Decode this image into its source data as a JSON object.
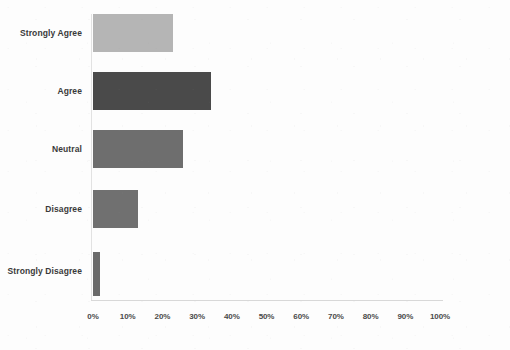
{
  "chart_data": {
    "type": "bar",
    "orientation": "horizontal",
    "title": "",
    "subtitle": "",
    "xlabel": "",
    "ylabel": "",
    "categories": [
      "Strongly Agree",
      "Agree",
      "Neutral",
      "Disagree",
      "Strongly Disagree"
    ],
    "values": [
      23,
      34,
      26,
      13,
      2
    ],
    "value_suffix": "%",
    "xlim": [
      0,
      100
    ],
    "xtick_labels": [
      "0%",
      "10%",
      "20%",
      "30%",
      "40%",
      "50%",
      "60%",
      "70%",
      "80%",
      "90%",
      "100%"
    ],
    "xtick_values": [
      0,
      10,
      20,
      30,
      40,
      50,
      60,
      70,
      80,
      90,
      100
    ],
    "grid": false,
    "legend": null,
    "data_labels": false,
    "bar_colors": [
      "#b5b5b5",
      "#4a4a4a",
      "#6e6e6e",
      "#707070",
      "#6a6a6a"
    ],
    "series": [
      {
        "name": "Response share",
        "points": [
          {
            "category": "Strongly Agree",
            "value": 23,
            "color": "#b5b5b5"
          },
          {
            "category": "Agree",
            "value": 34,
            "color": "#4a4a4a"
          },
          {
            "category": "Neutral",
            "value": 26,
            "color": "#6e6e6e"
          },
          {
            "category": "Disagree",
            "value": 13,
            "color": "#707070"
          },
          {
            "category": "Strongly Disagree",
            "value": 2,
            "color": "#6a6a6a"
          }
        ]
      }
    ]
  },
  "axis": {
    "baseline_color": "#d8d8d8",
    "tick_label_color": "#4a4a4a",
    "category_label_color": "#3a3a3a"
  }
}
